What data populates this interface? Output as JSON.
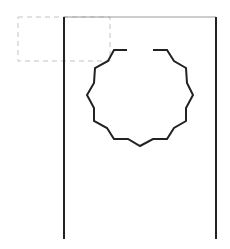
{
  "diagram": {
    "colors": {
      "stroke": "#222222",
      "frame_top": "#9a9a9a",
      "dashed": "#c4c4c4",
      "background": "#ffffff"
    },
    "frame": {
      "left_x": 64,
      "right_x": 216,
      "top_y": 17,
      "bottom_y": 239
    },
    "dashed_rect": {
      "x": 18,
      "y": 17,
      "width": 92,
      "height": 44
    },
    "gear_points": "127,50 114,50 108,61 95,68 94,83 87,95 94,108 94,121 107,128 114,139 128,139 140,146 153,139 167,139 174,128 186,121 186,108 193,95 187,83 186,68 174,61 167,50 153,50"
  }
}
